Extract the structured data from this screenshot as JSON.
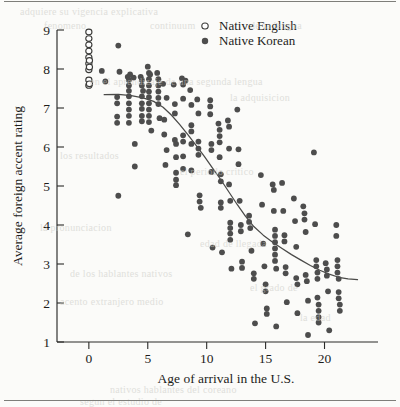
{
  "figure": {
    "background_color": "#fbfbf9",
    "ink_color": "#2b2b29",
    "marker_color": "#4d4d4d",
    "page_rule_color": "#7e7e7a"
  },
  "ghost_text": {
    "note": "faint bleed-through text from the reverse side of the scanned book page",
    "lines": [
      {
        "text": "adquiere su vigencia explicativa",
        "x": 20,
        "y": 6
      },
      {
        "text": "fenomeno",
        "x": 44,
        "y": 20
      },
      {
        "text": "continuum",
        "x": 150,
        "y": 20
      },
      {
        "text": "de la lengua",
        "x": 250,
        "y": 20
      },
      {
        "text": "en el aprendizaje de una segunda lengua",
        "x": 90,
        "y": 76
      },
      {
        "text": "la adquisicion",
        "x": 230,
        "y": 92
      },
      {
        "text": "los resultados",
        "x": 60,
        "y": 150
      },
      {
        "text": "el periodo critico",
        "x": 180,
        "y": 166
      },
      {
        "text": "la pronunciacion",
        "x": 40,
        "y": 222
      },
      {
        "text": "edad de llegada",
        "x": 200,
        "y": 238
      },
      {
        "text": "de los hablantes nativos",
        "x": 70,
        "y": 268
      },
      {
        "text": "acento extranjero medio",
        "x": 60,
        "y": 296
      },
      {
        "text": "el grado de",
        "x": 250,
        "y": 282
      },
      {
        "text": "la edad",
        "x": 300,
        "y": 312
      },
      {
        "text": "nativos hablantes del coreano",
        "x": 110,
        "y": 384
      },
      {
        "text": "segun el estudio de",
        "x": 80,
        "y": 396
      }
    ]
  },
  "chart_data": {
    "type": "scatter",
    "title": "",
    "xlabel": "Age of arrival in the U.S.",
    "ylabel": "Average foreign accent rating",
    "xlim": [
      -1.6,
      24.2
    ],
    "ylim": [
      1,
      9
    ],
    "xticks": [
      0,
      5,
      10,
      15,
      20
    ],
    "yticks": [
      1,
      2,
      3,
      4,
      5,
      6,
      7,
      8,
      9
    ],
    "grid": false,
    "legend_position": "top-center",
    "legend": [
      {
        "name": "Native English",
        "marker": "open-circle"
      },
      {
        "name": "Native Korean",
        "marker": "filled-circle"
      }
    ],
    "series": [
      {
        "name": "Native English",
        "marker": "open-circle",
        "color": "#ffffff",
        "edge_color": "#3a3a38",
        "points": [
          [
            0.0,
            8.95
          ],
          [
            0.0,
            8.78
          ],
          [
            0.0,
            8.62
          ],
          [
            0.0,
            8.46
          ],
          [
            0.0,
            8.3
          ],
          [
            0.0,
            8.14
          ],
          [
            0.0,
            7.98
          ],
          [
            0.05,
            8.22
          ],
          [
            0.05,
            8.05
          ],
          [
            0.0,
            7.72
          ],
          [
            0.0,
            7.58
          ],
          [
            0.05,
            7.62
          ]
        ]
      },
      {
        "name": "Native Korean",
        "marker": "filled-circle",
        "color": "#4d4d4d",
        "points": [
          [
            1.1,
            7.95
          ],
          [
            1.4,
            7.68
          ],
          [
            2.5,
            8.6
          ],
          [
            2.6,
            7.93
          ],
          [
            2.4,
            7.28
          ],
          [
            2.4,
            7.12
          ],
          [
            2.4,
            6.78
          ],
          [
            2.4,
            6.62
          ],
          [
            2.5,
            4.75
          ],
          [
            3.3,
            7.8
          ],
          [
            3.4,
            7.72
          ],
          [
            3.4,
            7.58
          ],
          [
            3.4,
            7.44
          ],
          [
            3.4,
            7.3
          ],
          [
            3.4,
            7.12
          ],
          [
            3.4,
            6.96
          ],
          [
            3.4,
            6.8
          ],
          [
            3.4,
            6.62
          ],
          [
            3.5,
            7.86
          ],
          [
            3.8,
            7.78
          ],
          [
            3.9,
            6.08
          ],
          [
            3.9,
            5.5
          ],
          [
            4.4,
            7.8
          ],
          [
            4.5,
            7.72
          ],
          [
            4.5,
            7.58
          ],
          [
            4.5,
            7.3
          ],
          [
            4.5,
            7.12
          ],
          [
            4.5,
            6.98
          ],
          [
            4.5,
            6.8
          ],
          [
            4.5,
            6.66
          ],
          [
            4.6,
            7.44
          ],
          [
            5.0,
            8.06
          ],
          [
            5.1,
            7.9
          ],
          [
            5.1,
            7.74
          ],
          [
            5.1,
            7.58
          ],
          [
            5.1,
            7.42
          ],
          [
            5.1,
            7.28
          ],
          [
            5.1,
            7.12
          ],
          [
            5.1,
            6.96
          ],
          [
            5.1,
            6.8
          ],
          [
            5.1,
            6.64
          ],
          [
            5.2,
            7.86
          ],
          [
            5.3,
            6.42
          ],
          [
            5.8,
            7.9
          ],
          [
            5.9,
            7.74
          ],
          [
            5.9,
            7.58
          ],
          [
            5.9,
            7.42
          ],
          [
            5.9,
            7.26
          ],
          [
            5.9,
            7.1
          ],
          [
            6.0,
            6.74
          ],
          [
            6.3,
            7.62
          ],
          [
            6.4,
            6.7
          ],
          [
            6.4,
            6.32
          ],
          [
            6.5,
            5.54
          ],
          [
            6.6,
            7.26
          ],
          [
            6.6,
            5.92
          ],
          [
            7.2,
            7.6
          ],
          [
            7.3,
            7.1
          ],
          [
            7.3,
            6.86
          ],
          [
            7.3,
            6.18
          ],
          [
            7.4,
            6.08
          ],
          [
            7.4,
            5.74
          ],
          [
            7.4,
            5.34
          ],
          [
            7.4,
            5.16
          ],
          [
            7.4,
            5.02
          ],
          [
            7.9,
            7.76
          ],
          [
            8.0,
            7.6
          ],
          [
            8.0,
            7.24
          ],
          [
            8.0,
            6.3
          ],
          [
            8.0,
            6.14
          ],
          [
            8.0,
            5.76
          ],
          [
            8.0,
            5.44
          ],
          [
            8.2,
            7.7
          ],
          [
            8.4,
            3.76
          ],
          [
            8.6,
            7.46
          ],
          [
            8.7,
            7.08
          ],
          [
            8.7,
            6.56
          ],
          [
            8.7,
            6.4
          ],
          [
            8.7,
            6.08
          ],
          [
            8.7,
            5.4
          ],
          [
            9.2,
            7.22
          ],
          [
            9.3,
            6.86
          ],
          [
            9.3,
            6.14
          ],
          [
            9.3,
            5.96
          ],
          [
            9.3,
            5.8
          ],
          [
            9.4,
            4.76
          ],
          [
            9.4,
            4.6
          ],
          [
            9.5,
            4.44
          ],
          [
            10.3,
            7.2
          ],
          [
            10.3,
            7.04
          ],
          [
            10.3,
            6.84
          ],
          [
            10.4,
            6.08
          ],
          [
            10.4,
            5.92
          ],
          [
            10.4,
            5.36
          ],
          [
            10.5,
            3.42
          ],
          [
            11.0,
            6.6
          ],
          [
            11.1,
            6.44
          ],
          [
            11.1,
            6.28
          ],
          [
            11.1,
            6.12
          ],
          [
            11.1,
            5.74
          ],
          [
            11.2,
            5.3
          ],
          [
            11.2,
            5.12
          ],
          [
            11.2,
            4.58
          ],
          [
            11.2,
            4.44
          ],
          [
            11.3,
            3.3
          ],
          [
            11.8,
            6.68
          ],
          [
            11.9,
            6.52
          ],
          [
            11.9,
            5.96
          ],
          [
            11.9,
            5.04
          ],
          [
            12.0,
            4.62
          ],
          [
            12.0,
            4.06
          ],
          [
            12.0,
            3.92
          ],
          [
            12.0,
            3.78
          ],
          [
            12.0,
            3.62
          ],
          [
            12.1,
            2.88
          ],
          [
            12.6,
            6.96
          ],
          [
            12.7,
            5.94
          ],
          [
            12.7,
            5.56
          ],
          [
            12.8,
            4.62
          ],
          [
            12.9,
            4.0
          ],
          [
            12.9,
            3.84
          ],
          [
            13.0,
            3.06
          ],
          [
            13.0,
            2.9
          ],
          [
            13.6,
            4.24
          ],
          [
            13.6,
            4.08
          ],
          [
            13.7,
            3.92
          ],
          [
            13.8,
            3.34
          ],
          [
            14.0,
            2.76
          ],
          [
            14.0,
            2.62
          ],
          [
            14.1,
            1.48
          ],
          [
            14.6,
            5.28
          ],
          [
            14.7,
            4.52
          ],
          [
            14.8,
            3.52
          ],
          [
            14.9,
            2.94
          ],
          [
            15.0,
            2.48
          ],
          [
            15.0,
            2.3
          ],
          [
            15.1,
            1.86
          ],
          [
            15.1,
            1.72
          ],
          [
            15.6,
            5.04
          ],
          [
            15.7,
            4.9
          ],
          [
            15.7,
            4.36
          ],
          [
            15.8,
            3.88
          ],
          [
            15.8,
            3.72
          ],
          [
            15.8,
            3.56
          ],
          [
            15.8,
            3.4
          ],
          [
            15.8,
            3.24
          ],
          [
            15.8,
            3.08
          ],
          [
            15.9,
            2.88
          ],
          [
            15.9,
            1.4
          ],
          [
            16.4,
            5.08
          ],
          [
            16.5,
            4.36
          ],
          [
            16.6,
            3.74
          ],
          [
            16.6,
            3.58
          ],
          [
            16.7,
            2.92
          ],
          [
            16.7,
            2.76
          ],
          [
            16.8,
            2.02
          ],
          [
            17.4,
            4.68
          ],
          [
            17.5,
            4.1
          ],
          [
            17.6,
            3.44
          ],
          [
            17.6,
            2.64
          ],
          [
            17.7,
            2.48
          ],
          [
            17.7,
            1.74
          ],
          [
            18.2,
            4.48
          ],
          [
            18.3,
            4.3
          ],
          [
            18.3,
            4.14
          ],
          [
            18.4,
            3.82
          ],
          [
            18.4,
            2.72
          ],
          [
            18.5,
            2.56
          ],
          [
            18.6,
            2.06
          ],
          [
            18.6,
            1.18
          ],
          [
            19.1,
            5.86
          ],
          [
            19.2,
            4.02
          ],
          [
            19.3,
            3.1
          ],
          [
            19.3,
            2.94
          ],
          [
            19.4,
            2.78
          ],
          [
            19.4,
            2.62
          ],
          [
            19.4,
            2.14
          ],
          [
            19.5,
            1.96
          ],
          [
            19.5,
            1.8
          ],
          [
            19.5,
            1.64
          ],
          [
            19.5,
            1.5
          ],
          [
            20.1,
            3.02
          ],
          [
            20.2,
            2.86
          ],
          [
            20.2,
            2.7
          ],
          [
            20.3,
            2.3
          ],
          [
            20.4,
            1.3
          ],
          [
            21.0,
            4.0
          ],
          [
            21.0,
            3.72
          ],
          [
            21.1,
            3.1
          ],
          [
            21.1,
            2.94
          ],
          [
            21.1,
            2.78
          ],
          [
            21.2,
            2.62
          ],
          [
            21.2,
            2.28
          ],
          [
            21.2,
            2.12
          ],
          [
            21.3,
            1.96
          ],
          [
            21.3,
            1.8
          ]
        ]
      }
    ],
    "fit_curve": {
      "name": "smoothed trend line",
      "color": "#4a4a48",
      "points": [
        [
          1.3,
          7.34
        ],
        [
          2.5,
          7.35
        ],
        [
          3.6,
          7.32
        ],
        [
          4.6,
          7.26
        ],
        [
          5.5,
          7.17
        ],
        [
          6.3,
          7.02
        ],
        [
          7.0,
          6.82
        ],
        [
          7.7,
          6.58
        ],
        [
          8.4,
          6.32
        ],
        [
          9.1,
          6.04
        ],
        [
          9.8,
          5.76
        ],
        [
          10.5,
          5.46
        ],
        [
          11.2,
          5.16
        ],
        [
          11.9,
          4.84
        ],
        [
          12.6,
          4.52
        ],
        [
          13.3,
          4.22
        ],
        [
          14.0,
          3.96
        ],
        [
          14.8,
          3.74
        ],
        [
          15.6,
          3.56
        ],
        [
          16.4,
          3.4
        ],
        [
          17.2,
          3.24
        ],
        [
          18.0,
          3.1
        ],
        [
          18.8,
          2.96
        ],
        [
          19.6,
          2.84
        ],
        [
          20.4,
          2.74
        ],
        [
          21.2,
          2.66
        ],
        [
          22.0,
          2.62
        ],
        [
          22.8,
          2.6
        ]
      ]
    }
  }
}
